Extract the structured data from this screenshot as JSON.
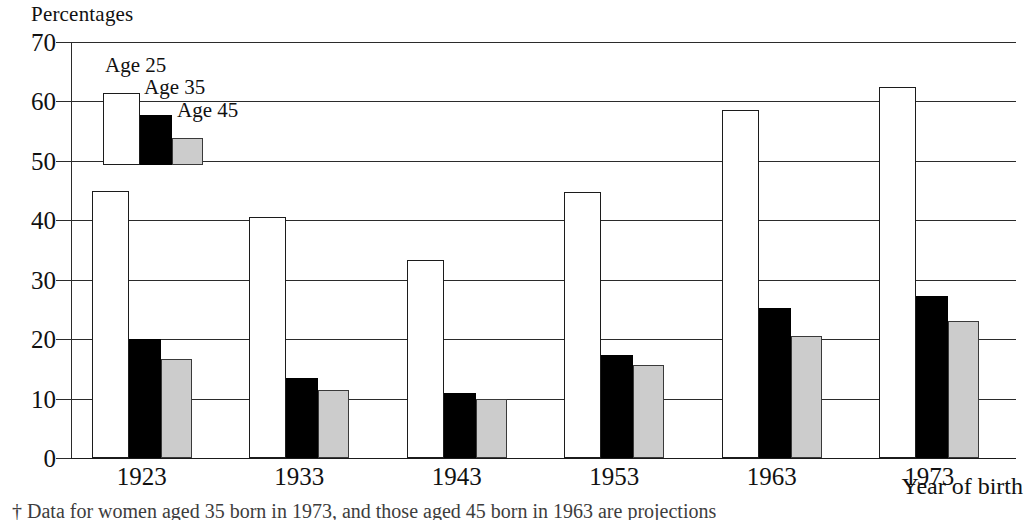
{
  "chart_data": {
    "type": "bar",
    "title": "",
    "ylabel": "Percentages",
    "xlabel": "Year of birth",
    "categories": [
      "1923",
      "1933",
      "1943",
      "1953",
      "1963",
      "1973"
    ],
    "series": [
      {
        "name": "Age 25",
        "color": "#ffffff",
        "values": [
          45.0,
          40.5,
          33.4,
          44.8,
          58.5,
          62.5
        ]
      },
      {
        "name": "Age 35",
        "color": "#000000",
        "values": [
          20.1,
          13.5,
          11.0,
          17.4,
          25.3,
          27.2
        ]
      },
      {
        "name": "Age 45",
        "color": "#cccccc",
        "values": [
          16.7,
          11.4,
          10.0,
          15.7,
          20.6,
          23.0
        ]
      }
    ],
    "ylim": [
      0,
      70
    ],
    "ytick_labels": [
      "70",
      "60",
      "50",
      "40",
      "30",
      "20",
      "10",
      "0"
    ],
    "ytick_values": [
      70,
      60,
      50,
      40,
      30,
      20,
      10,
      0
    ],
    "grid": "horizontal",
    "legend_position": "inside-top-left",
    "legend_style": "mini-bar-sample"
  },
  "footnote": {
    "text": "† Data for women aged 35 born in 1973, and those aged 45 born in 1963 are projections"
  },
  "colors": {
    "axis": "#2b2b2b",
    "text": "#111111",
    "series_age25": "#ffffff",
    "series_age35": "#000000",
    "series_age45": "#cccccc"
  }
}
